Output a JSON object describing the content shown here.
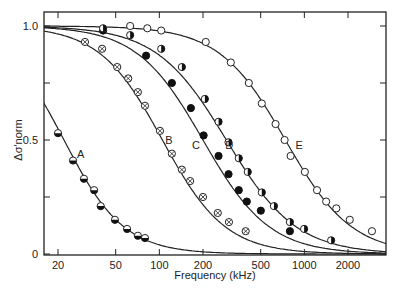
{
  "chart_data": {
    "type": "scatter",
    "title": "",
    "xlabel": "Frequency (kHz)",
    "ylabel": "Δσ′norm",
    "xscale": "log",
    "xlim": [
      16,
      3600
    ],
    "ylim": [
      0,
      1.05
    ],
    "grid": false,
    "legend": "none (curves labeled inline A–E)",
    "x_ticks": [
      20,
      50,
      100,
      200,
      500,
      1000,
      2000
    ],
    "y_ticks": [
      0,
      0.5,
      1.0
    ],
    "y_minor_ticks": [
      0.25,
      0.75
    ],
    "series": [
      {
        "name": "A",
        "marker": "half-filled-bottom",
        "label_pos": [
          27,
          0.44
        ],
        "x": [
          20,
          25.4,
          30.2,
          35.5,
          39.4,
          49.4,
          59.9,
          71.1,
          79.6
        ],
        "y": [
          0.53,
          0.41,
          0.33,
          0.28,
          0.21,
          0.15,
          0.11,
          0.08,
          0.07
        ],
        "fit": {
          "f0": 16.5,
          "f50": 22,
          "n": 2.1,
          "max": 1.0
        }
      },
      {
        "name": "B",
        "marker": "circle-cross",
        "label_pos": [
          110,
          0.5
        ],
        "x": [
          30.7,
          40.3,
          51.2,
          61.0,
          71.1,
          79.6,
          101,
          122,
          143,
          163,
          200,
          253,
          302,
          394
        ],
        "y": [
          0.93,
          0.9,
          0.82,
          0.77,
          0.71,
          0.65,
          0.54,
          0.44,
          0.37,
          0.32,
          0.25,
          0.18,
          0.14,
          0.1
        ],
        "fit": {
          "f50": 105,
          "n": 2.0,
          "max": 1.0
        }
      },
      {
        "name": "C",
        "marker": "filled",
        "label_pos": [
          168,
          0.48
        ],
        "x": [
          40.9,
          81.0,
          122,
          165,
          202,
          256,
          300,
          353,
          401,
          501,
          795
        ],
        "y": [
          0.98,
          0.87,
          0.75,
          0.64,
          0.52,
          0.43,
          0.35,
          0.28,
          0.23,
          0.19,
          0.1
        ],
        "fit": {
          "f50": 200,
          "n": 1.9,
          "max": 1.0
        }
      },
      {
        "name": "D",
        "marker": "half-filled-right",
        "label_pos": [
          285,
          0.48
        ],
        "x": [
          40.9,
          62.9,
          103,
          143,
          206,
          256,
          300,
          353,
          407,
          509,
          617,
          795,
          996,
          1530
        ],
        "y": [
          0.99,
          0.96,
          0.9,
          0.82,
          0.68,
          0.58,
          0.49,
          0.42,
          0.36,
          0.27,
          0.21,
          0.14,
          0.11,
          0.06
        ],
        "fit": {
          "f50": 290,
          "n": 1.8,
          "max": 1.0
        }
      },
      {
        "name": "E",
        "marker": "open",
        "label_pos": [
          870,
          0.48
        ],
        "x": [
          62.9,
          82.6,
          103,
          209,
          311,
          414,
          509,
          633,
          731,
          804,
          1008,
          1223,
          1414,
          1661,
          2057,
          2926
        ],
        "y": [
          1.0,
          0.99,
          0.98,
          0.93,
          0.84,
          0.75,
          0.66,
          0.57,
          0.5,
          0.43,
          0.36,
          0.28,
          0.23,
          0.2,
          0.15,
          0.1
        ],
        "fit": {
          "f50": 740,
          "n": 1.9,
          "max": 1.0
        }
      }
    ]
  }
}
